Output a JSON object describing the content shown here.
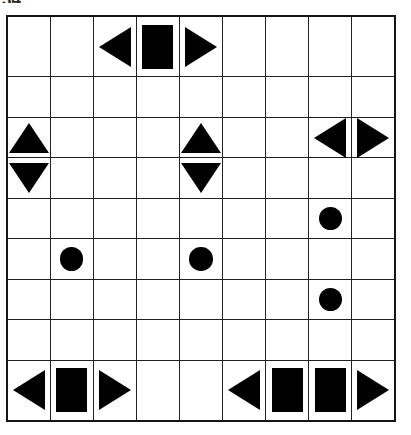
{
  "artifact": {
    "corner_text": "34"
  },
  "grid": {
    "rows": 9,
    "cols": 9,
    "background_color": "#ffffff",
    "line_color": "#222222",
    "border_color": "#161616",
    "shape_color": "#000000",
    "shape_names": {
      "empty": "",
      "square": "square-icon",
      "circle": "circle-icon",
      "tri-left": "triangle-left-icon",
      "tri-right": "triangle-right-icon",
      "tri-up": "triangle-up-icon",
      "tri-down": "triangle-down-icon"
    },
    "cells": [
      [
        "empty",
        "empty",
        "tri-left",
        "square",
        "tri-right",
        "empty",
        "empty",
        "empty",
        "empty"
      ],
      [
        "empty",
        "empty",
        "empty",
        "empty",
        "empty",
        "empty",
        "empty",
        "empty",
        "empty"
      ],
      [
        "tri-up",
        "empty",
        "empty",
        "empty",
        "tri-up",
        "empty",
        "empty",
        "tri-left",
        "tri-right"
      ],
      [
        "tri-down",
        "empty",
        "empty",
        "empty",
        "tri-down",
        "empty",
        "empty",
        "empty",
        "empty"
      ],
      [
        "empty",
        "empty",
        "empty",
        "empty",
        "empty",
        "empty",
        "empty",
        "circle",
        "empty"
      ],
      [
        "empty",
        "circle",
        "empty",
        "empty",
        "circle",
        "empty",
        "empty",
        "empty",
        "empty"
      ],
      [
        "empty",
        "empty",
        "empty",
        "empty",
        "empty",
        "empty",
        "empty",
        "circle",
        "empty"
      ],
      [
        "empty",
        "empty",
        "empty",
        "empty",
        "empty",
        "empty",
        "empty",
        "empty",
        "empty"
      ],
      [
        "tri-left",
        "square",
        "tri-right",
        "empty",
        "empty",
        "tri-left",
        "square",
        "square",
        "tri-right"
      ]
    ]
  }
}
